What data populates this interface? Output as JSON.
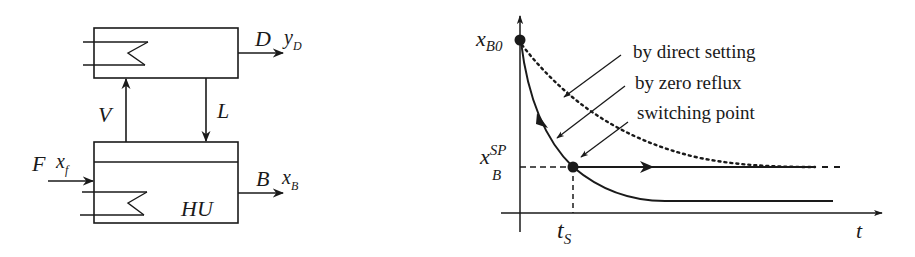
{
  "process_diagram": {
    "condenser_label": "",
    "reboiler_label": "HU",
    "distillate": {
      "stream": "D",
      "composition": "y",
      "composition_sub": "D"
    },
    "bottoms": {
      "stream": "B",
      "composition": "x",
      "composition_sub": "B"
    },
    "feed": {
      "stream": "F",
      "composition": "x",
      "composition_sub": "f"
    },
    "vapor": "V",
    "liquid": "L"
  },
  "trajectory_plot": {
    "y_start_label": {
      "main": "x",
      "sub": "B0"
    },
    "y_setpoint_label": {
      "main": "x",
      "sup": "SP",
      "sub": "B"
    },
    "x_switch_label": {
      "main": "t",
      "sub": "S"
    },
    "x_axis_label": "t",
    "annotations": [
      {
        "text": "by direct setting"
      },
      {
        "text": "by zero reflux"
      },
      {
        "text": "switching point"
      }
    ]
  },
  "colors": {
    "ink": "#1a1a1a",
    "background": "#ffffff"
  }
}
